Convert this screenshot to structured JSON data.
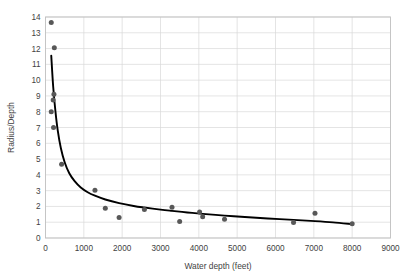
{
  "chart_data": {
    "type": "scatter",
    "title": "",
    "xlabel": "Water depth (feet)",
    "ylabel": "Radius/Depth",
    "xlim": [
      0,
      9000
    ],
    "ylim": [
      0,
      14
    ],
    "xticks": [
      0,
      1000,
      2000,
      3000,
      4000,
      5000,
      6000,
      7000,
      8000,
      9000
    ],
    "yticks": [
      0,
      1,
      2,
      3,
      4,
      5,
      6,
      7,
      8,
      9,
      10,
      11,
      12,
      13,
      14
    ],
    "grid": true,
    "legend": "none",
    "marker_color": "#585858",
    "curve_color": "#000000",
    "gridline_color": "#d9d9d9",
    "series": [
      {
        "name": "Radius/Depth observations",
        "type": "scatter",
        "points": [
          {
            "x": 150,
            "y": 13.65
          },
          {
            "x": 230,
            "y": 12.05
          },
          {
            "x": 220,
            "y": 9.1
          },
          {
            "x": 200,
            "y": 8.75
          },
          {
            "x": 150,
            "y": 8.0
          },
          {
            "x": 210,
            "y": 7.0
          },
          {
            "x": 420,
            "y": 4.67
          },
          {
            "x": 1290,
            "y": 3.03
          },
          {
            "x": 1560,
            "y": 1.88
          },
          {
            "x": 1920,
            "y": 1.3
          },
          {
            "x": 2580,
            "y": 1.81
          },
          {
            "x": 3300,
            "y": 1.95
          },
          {
            "x": 3500,
            "y": 1.05
          },
          {
            "x": 4020,
            "y": 1.65
          },
          {
            "x": 4100,
            "y": 1.35
          },
          {
            "x": 4670,
            "y": 1.18
          },
          {
            "x": 6470,
            "y": 0.98
          },
          {
            "x": 7030,
            "y": 1.57
          },
          {
            "x": 8000,
            "y": 0.9
          }
        ]
      },
      {
        "name": "Fitted power-law trend",
        "type": "line",
        "points": [
          {
            "x": 150,
            "y": 11.55
          },
          {
            "x": 200,
            "y": 9.6
          },
          {
            "x": 260,
            "y": 8.0
          },
          {
            "x": 320,
            "y": 6.8
          },
          {
            "x": 400,
            "y": 5.7
          },
          {
            "x": 500,
            "y": 4.8
          },
          {
            "x": 620,
            "y": 4.1
          },
          {
            "x": 760,
            "y": 3.6
          },
          {
            "x": 920,
            "y": 3.2
          },
          {
            "x": 1100,
            "y": 2.9
          },
          {
            "x": 1290,
            "y": 2.68
          },
          {
            "x": 1560,
            "y": 2.44
          },
          {
            "x": 1920,
            "y": 2.21
          },
          {
            "x": 2300,
            "y": 2.03
          },
          {
            "x": 2580,
            "y": 1.93
          },
          {
            "x": 3000,
            "y": 1.8
          },
          {
            "x": 3300,
            "y": 1.72
          },
          {
            "x": 3700,
            "y": 1.62
          },
          {
            "x": 4100,
            "y": 1.53
          },
          {
            "x": 4670,
            "y": 1.42
          },
          {
            "x": 5200,
            "y": 1.33
          },
          {
            "x": 5800,
            "y": 1.24
          },
          {
            "x": 6470,
            "y": 1.15
          },
          {
            "x": 7030,
            "y": 1.07
          },
          {
            "x": 7500,
            "y": 0.99
          },
          {
            "x": 8000,
            "y": 0.88
          }
        ]
      }
    ]
  }
}
